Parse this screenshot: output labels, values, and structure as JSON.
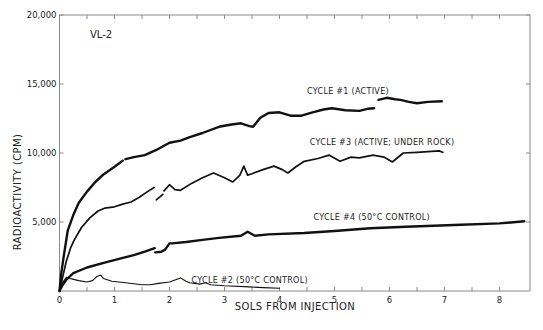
{
  "chart_data": {
    "type": "line",
    "title": "",
    "panel_label": "VL-2",
    "xlabel": "SOLS FROM INJECTION",
    "ylabel": "RADIOACTIVITY (CPM)",
    "xlim": [
      0,
      8.55
    ],
    "ylim": [
      0,
      20000
    ],
    "x_ticks": [
      0,
      0.5,
      1,
      1.5,
      2,
      2.5,
      3,
      3.5,
      4,
      4.5,
      5,
      5.5,
      6,
      6.5,
      7,
      7.5,
      8
    ],
    "x_tick_labels": [
      {
        "value": 0,
        "label": "0"
      },
      {
        "value": 1,
        "label": "1"
      },
      {
        "value": 2,
        "label": "2"
      },
      {
        "value": 3,
        "label": "3"
      },
      {
        "value": 4,
        "label": "4"
      },
      {
        "value": 5,
        "label": "5"
      },
      {
        "value": 6,
        "label": "6"
      },
      {
        "value": 7,
        "label": "7"
      },
      {
        "value": 8,
        "label": "8"
      }
    ],
    "y_ticks": [
      {
        "value": 5000,
        "label": "5,000"
      },
      {
        "value": 10000,
        "label": "10,000"
      },
      {
        "value": 15000,
        "label": "15,000"
      },
      {
        "value": 20000,
        "label": "20,000"
      }
    ],
    "grid": false,
    "legend": "inline annotations",
    "series": [
      {
        "name": "CYCLE #1 (ACTIVE)",
        "weight": "heavy",
        "segments": [
          [
            [
              0,
              0
            ],
            [
              0.03,
              1200
            ],
            [
              0.08,
              2600
            ],
            [
              0.15,
              4400
            ],
            [
              0.25,
              5500
            ],
            [
              0.35,
              6400
            ],
            [
              0.5,
              7200
            ],
            [
              0.65,
              7900
            ],
            [
              0.8,
              8450
            ],
            [
              1.0,
              9000
            ],
            [
              1.15,
              9450
            ]
          ],
          [
            [
              1.2,
              9550
            ],
            [
              1.35,
              9700
            ],
            [
              1.55,
              9850
            ],
            [
              1.75,
              10200
            ],
            [
              2.0,
              10750
            ],
            [
              2.2,
              10900
            ],
            [
              2.37,
              11150
            ],
            [
              2.6,
              11450
            ],
            [
              2.9,
              11900
            ],
            [
              3.1,
              12050
            ],
            [
              3.3,
              12150
            ],
            [
              3.45,
              11950
            ],
            [
              3.52,
              11900
            ],
            [
              3.65,
              12550
            ],
            [
              3.8,
              12900
            ],
            [
              4.0,
              12950
            ],
            [
              4.2,
              12700
            ],
            [
              4.4,
              12700
            ],
            [
              4.6,
              12950
            ],
            [
              4.8,
              13150
            ],
            [
              4.95,
              13250
            ],
            [
              5.2,
              13100
            ],
            [
              5.45,
              13050
            ],
            [
              5.6,
              13200
            ],
            [
              5.72,
              13250
            ]
          ],
          [
            [
              5.8,
              13850
            ],
            [
              5.95,
              14000
            ],
            [
              6.1,
              13900
            ],
            [
              6.2,
              13850
            ],
            [
              6.35,
              13700
            ],
            [
              6.5,
              13600
            ],
            [
              6.7,
              13700
            ],
            [
              6.95,
              13750
            ]
          ]
        ]
      },
      {
        "name": "CYCLE #3 (ACTIVE; UNDER ROCK)",
        "weight": "medium",
        "segments": [
          [
            [
              0,
              0
            ],
            [
              0.05,
              900
            ],
            [
              0.12,
              2100
            ],
            [
              0.2,
              3100
            ],
            [
              0.27,
              3700
            ],
            [
              0.4,
              4600
            ],
            [
              0.55,
              5300
            ],
            [
              0.7,
              5800
            ],
            [
              0.82,
              6000
            ],
            [
              1.0,
              6100
            ],
            [
              1.15,
              6300
            ],
            [
              1.3,
              6450
            ],
            [
              1.45,
              6800
            ],
            [
              1.6,
              7200
            ],
            [
              1.72,
              7500
            ]
          ],
          [
            [
              1.76,
              6600
            ],
            [
              1.82,
              6800
            ],
            [
              1.88,
              7000
            ]
          ],
          [
            [
              1.9,
              7250
            ],
            [
              2.0,
              7700
            ],
            [
              2.1,
              7350
            ],
            [
              2.2,
              7300
            ],
            [
              2.4,
              7800
            ],
            [
              2.6,
              8200
            ],
            [
              2.8,
              8550
            ],
            [
              3.0,
              8200
            ],
            [
              3.15,
              7900
            ],
            [
              3.28,
              8400
            ],
            [
              3.35,
              9050
            ],
            [
              3.42,
              8400
            ],
            [
              3.5,
              8500
            ],
            [
              3.7,
              8800
            ],
            [
              3.9,
              9050
            ],
            [
              4.05,
              8800
            ],
            [
              4.15,
              8550
            ],
            [
              4.3,
              9000
            ],
            [
              4.45,
              9400
            ],
            [
              4.7,
              9600
            ],
            [
              4.9,
              9850
            ],
            [
              5.1,
              9400
            ],
            [
              5.3,
              9700
            ],
            [
              5.45,
              9650
            ],
            [
              5.7,
              9850
            ],
            [
              5.9,
              9700
            ],
            [
              6.05,
              9350
            ],
            [
              6.25,
              10000
            ],
            [
              6.5,
              10050
            ],
            [
              6.7,
              10100
            ],
            [
              6.9,
              10150
            ],
            [
              6.97,
              10050
            ]
          ]
        ]
      },
      {
        "name": "CYCLE #4 (50°C CONTROL)",
        "weight": "heavy",
        "segments": [
          [
            [
              0,
              0
            ],
            [
              0.05,
              400
            ],
            [
              0.12,
              800
            ],
            [
              0.25,
              1300
            ],
            [
              0.5,
              1700
            ],
            [
              0.82,
              2050
            ],
            [
              1.1,
              2350
            ],
            [
              1.35,
              2600
            ],
            [
              1.55,
              2850
            ],
            [
              1.73,
              3100
            ]
          ],
          [
            [
              1.74,
              2800
            ],
            [
              1.85,
              2850
            ],
            [
              1.92,
              3000
            ],
            [
              2.0,
              3450
            ],
            [
              2.05,
              3450
            ],
            [
              2.3,
              3550
            ],
            [
              2.6,
              3700
            ],
            [
              2.9,
              3850
            ],
            [
              3.3,
              4000
            ],
            [
              3.42,
              4300
            ],
            [
              3.55,
              4000
            ],
            [
              3.8,
              4100
            ],
            [
              4.45,
              4200
            ],
            [
              5.0,
              4350
            ],
            [
              5.65,
              4550
            ],
            [
              6.3,
              4650
            ],
            [
              7.3,
              4800
            ],
            [
              8.0,
              4900
            ],
            [
              8.45,
              5050
            ]
          ]
        ]
      },
      {
        "name": "CYCLE #2 (50°C CONTROL)",
        "weight": "light",
        "segments": [
          [
            [
              0,
              0
            ],
            [
              0.05,
              600
            ],
            [
              0.13,
              1000
            ],
            [
              0.2,
              900
            ],
            [
              0.35,
              750
            ],
            [
              0.5,
              650
            ],
            [
              0.6,
              750
            ],
            [
              0.68,
              1050
            ],
            [
              0.75,
              1150
            ],
            [
              0.8,
              900
            ],
            [
              0.95,
              700
            ],
            [
              1.2,
              600
            ],
            [
              1.5,
              450
            ],
            [
              1.65,
              450
            ],
            [
              1.8,
              550
            ],
            [
              2.0,
              650
            ],
            [
              2.2,
              950
            ],
            [
              2.3,
              700
            ],
            [
              2.37,
              600
            ],
            [
              2.55,
              500
            ],
            [
              2.65,
              600
            ],
            [
              2.75,
              450
            ],
            [
              3.0,
              380
            ],
            [
              3.45,
              300
            ],
            [
              3.7,
              250
            ],
            [
              4.0,
              200
            ]
          ]
        ]
      }
    ],
    "annotations": [
      {
        "text": "CYCLE #1 (ACTIVE)",
        "x": 4.5,
        "y": 14300
      },
      {
        "text": "CYCLE #3 (ACTIVE; UNDER ROCK)",
        "x": 4.55,
        "y": 10600
      },
      {
        "text": "CYCLE #4 (50°C CONTROL)",
        "x": 4.62,
        "y": 5150
      },
      {
        "text": "CYCLE #2 (50°C CONTROL)",
        "x": 2.4,
        "y": 600
      }
    ],
    "colors": {
      "line": "#111111",
      "axis": "#8a8a8a",
      "text": "#222222",
      "background": "#ffffff"
    }
  }
}
